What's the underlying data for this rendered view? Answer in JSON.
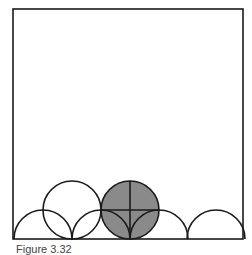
{
  "figure": {
    "caption": "Figure 3.32",
    "square": {
      "x": 13,
      "y": 9,
      "size": 230
    },
    "semicircles": [
      {
        "cx": 43,
        "cy": 239,
        "r": 29
      },
      {
        "cx": 101,
        "cy": 239,
        "r": 29
      },
      {
        "cx": 159,
        "cy": 239,
        "r": 29
      },
      {
        "cx": 216,
        "cy": 239,
        "r": 29
      }
    ],
    "circles": [
      {
        "cx": 72,
        "cy": 210,
        "r": 29,
        "fill": "none"
      },
      {
        "cx": 130,
        "cy": 210,
        "r": 29,
        "fill": "#8a8a8a"
      }
    ],
    "colors": {
      "stroke": "#1a1a1a",
      "shade": "#8a8a8a"
    }
  }
}
